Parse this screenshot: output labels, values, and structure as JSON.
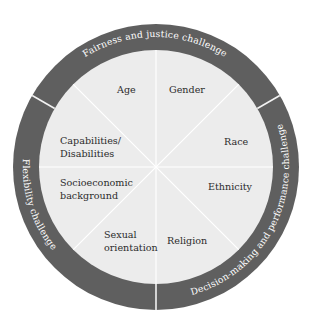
{
  "diagram": {
    "type": "wheel",
    "colors": {
      "ring": "#5f5f5f",
      "inner": "#ececec",
      "lines": "#ffffff",
      "segment_text": "#2b2b2b",
      "ring_text": "#ffffff"
    },
    "segments": [
      {
        "lines": [
          "Age"
        ]
      },
      {
        "lines": [
          "Gender"
        ]
      },
      {
        "lines": [
          "Race"
        ]
      },
      {
        "lines": [
          "Ethnicity"
        ]
      },
      {
        "lines": [
          "Religion"
        ]
      },
      {
        "lines": [
          "Sexual",
          "orientation"
        ]
      },
      {
        "lines": [
          "Socioeconomic",
          "background"
        ]
      },
      {
        "lines": [
          "Capabilities/",
          "Disabilities"
        ]
      }
    ],
    "ring_labels": [
      {
        "label": "Fairness and justice challenge"
      },
      {
        "label": "Decision-making and performance challenge"
      },
      {
        "label": "Flexibility challenge"
      }
    ]
  }
}
